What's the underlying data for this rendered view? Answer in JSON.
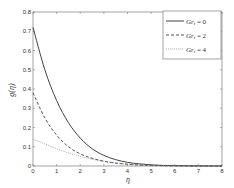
{
  "chart_data": {
    "type": "line",
    "title": "",
    "xlabel": "η",
    "ylabel": "g(η)",
    "xlim": [
      0,
      8
    ],
    "ylim": [
      0,
      0.8
    ],
    "xticks": [
      "0",
      "1",
      "2",
      "3",
      "4",
      "5",
      "6",
      "7",
      "8"
    ],
    "yticks": [
      "0",
      "0.1",
      "0.2",
      "0.3",
      "0.4",
      "0.5",
      "0.6",
      "0.7",
      "0.8"
    ],
    "grid": false,
    "legend_position": "upper right",
    "x": [
      0,
      0.5,
      1,
      1.5,
      2,
      2.5,
      3,
      3.5,
      4,
      4.5,
      5,
      5.5,
      6,
      6.5,
      7,
      7.5,
      8
    ],
    "series": [
      {
        "name": "Gr_t = 0",
        "legend_label": "Gr_t = 0",
        "style": "solid",
        "color": "#404040",
        "values": [
          0.72,
          0.5,
          0.34,
          0.225,
          0.145,
          0.09,
          0.055,
          0.033,
          0.019,
          0.011,
          0.006,
          0.003,
          0.002,
          0.001,
          0.0005,
          0.0002,
          0.0
        ]
      },
      {
        "name": "Gr_t = 2",
        "legend_label": "Gr_t = 2",
        "style": "dashed",
        "color": "#404040",
        "values": [
          0.38,
          0.25,
          0.16,
          0.1,
          0.063,
          0.04,
          0.025,
          0.015,
          0.009,
          0.005,
          0.003,
          0.0015,
          0.0008,
          0.0004,
          0.0002,
          0.0001,
          0.0
        ]
      },
      {
        "name": "Gr_t = 4",
        "legend_label": "Gr_t = 4",
        "style": "dotted",
        "color": "#808080",
        "values": [
          0.14,
          0.115,
          0.09,
          0.068,
          0.05,
          0.035,
          0.024,
          0.016,
          0.01,
          0.006,
          0.0035,
          0.002,
          0.001,
          0.0005,
          0.0002,
          0.0001,
          0.0
        ]
      }
    ]
  },
  "legend": {
    "items": [
      {
        "prefix": "Gr",
        "sub": "t",
        "suffix": " = 0"
      },
      {
        "prefix": "Gr",
        "sub": "t",
        "suffix": " = 2"
      },
      {
        "prefix": "Gr",
        "sub": "t",
        "suffix": " = 4"
      }
    ]
  },
  "axes": {
    "xlabel": "η",
    "ylabel": "g(η)"
  }
}
